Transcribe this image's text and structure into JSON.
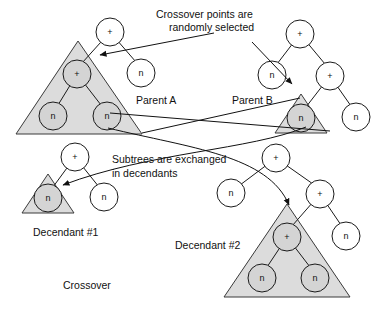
{
  "figure": {
    "title": "Crossover",
    "annotations": [
      {
        "id": "crossover-points",
        "line1": "Crossover points are",
        "line2": "randomly selected"
      },
      {
        "id": "subtrees-exchanged",
        "line1": "Subtrees are exchanged",
        "line2": "in decendants"
      }
    ],
    "captions": {
      "parent_a": "Parent A",
      "parent_b": "Parent B",
      "decendant_1": "Decendant #1",
      "decendant_2": "Decendant #2",
      "crossover": "Crossover"
    },
    "colors": {
      "stroke": "#1a1a1a",
      "triangle_fill": "#dcdcdc",
      "node_fill": "#ffffff",
      "node_shaded_fill": "#d4d4d4",
      "background": "#ffffff"
    },
    "trees": [
      {
        "id": "parent-a",
        "label": "Parent A",
        "nodes": [
          {
            "id": "pa-root",
            "label": "+",
            "x": 110,
            "y": 32,
            "r": 14,
            "shaded": false
          },
          {
            "id": "pa-right-leaf",
            "label": "n",
            "x": 141,
            "y": 73,
            "r": 14,
            "shaded": false
          },
          {
            "id": "pa-sub-root",
            "label": "+",
            "x": 77,
            "y": 74,
            "r": 14,
            "shaded": true
          },
          {
            "id": "pa-sub-left",
            "label": "n",
            "x": 53,
            "y": 116,
            "r": 14,
            "shaded": true
          },
          {
            "id": "pa-sub-right",
            "label": "n",
            "x": 107,
            "y": 116,
            "r": 14,
            "shaded": true
          }
        ],
        "subtree_triangle": {
          "apex_x": 78,
          "apex_y": 41,
          "left_x": 16,
          "right_x": 142,
          "base_y": 134
        }
      },
      {
        "id": "parent-b",
        "label": "Parent B",
        "nodes": [
          {
            "id": "pb-root",
            "label": "+",
            "x": 300,
            "y": 34,
            "r": 14,
            "shaded": false
          },
          {
            "id": "pb-left-leaf",
            "label": "n",
            "x": 272,
            "y": 75,
            "r": 14,
            "shaded": false
          },
          {
            "id": "pb-right",
            "label": "+",
            "x": 330,
            "y": 76,
            "r": 14,
            "shaded": false
          },
          {
            "id": "pb-sub-root",
            "label": "n",
            "x": 301,
            "y": 118,
            "r": 14,
            "shaded": true
          },
          {
            "id": "pb-right-leaf",
            "label": "n",
            "x": 356,
            "y": 117,
            "r": 14,
            "shaded": false
          }
        ],
        "subtree_triangle": {
          "apex_x": 301,
          "apex_y": 94,
          "left_x": 275,
          "right_x": 327,
          "base_y": 133
        }
      },
      {
        "id": "decendant-1",
        "label": "Decendant #1",
        "nodes": [
          {
            "id": "d1-root",
            "label": "+",
            "x": 75,
            "y": 157,
            "r": 14,
            "shaded": false
          },
          {
            "id": "d1-right-leaf",
            "label": "n",
            "x": 104,
            "y": 197,
            "r": 14,
            "shaded": false
          },
          {
            "id": "d1-sub-root",
            "label": "n",
            "x": 48,
            "y": 198,
            "r": 14,
            "shaded": true
          }
        ],
        "subtree_triangle": {
          "apex_x": 48,
          "apex_y": 174,
          "left_x": 22,
          "right_x": 74,
          "base_y": 213
        }
      },
      {
        "id": "decendant-2",
        "label": "Decendant #2",
        "nodes": [
          {
            "id": "d2-root",
            "label": "+",
            "x": 276,
            "y": 158,
            "r": 14,
            "shaded": false
          },
          {
            "id": "d2-left-leaf",
            "label": "n",
            "x": 231,
            "y": 193,
            "r": 14,
            "shaded": false
          },
          {
            "id": "d2-right",
            "label": "+",
            "x": 320,
            "y": 194,
            "r": 14,
            "shaded": false
          },
          {
            "id": "d2-right-leaf",
            "label": "n",
            "x": 346,
            "y": 236,
            "r": 14,
            "shaded": false
          },
          {
            "id": "d2-sub-root",
            "label": "+",
            "x": 287,
            "y": 237,
            "r": 14,
            "shaded": true
          },
          {
            "id": "d2-sub-left",
            "label": "n",
            "x": 262,
            "y": 278,
            "r": 14,
            "shaded": true
          },
          {
            "id": "d2-sub-right",
            "label": "n",
            "x": 315,
            "y": 278,
            "r": 14,
            "shaded": true
          }
        ],
        "subtree_triangle": {
          "apex_x": 287,
          "apex_y": 204,
          "left_x": 224,
          "right_x": 350,
          "base_y": 297
        }
      }
    ]
  }
}
